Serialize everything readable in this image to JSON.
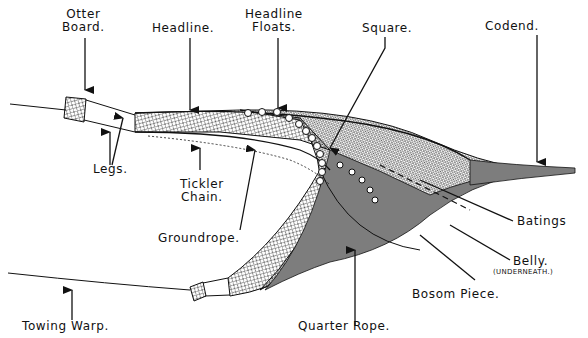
{
  "diagram": {
    "colors": {
      "ink": "#111111",
      "background": "#ffffff"
    },
    "labels": {
      "otter_board": [
        "Otter",
        "Board."
      ],
      "headline": "Headline.",
      "headline_floats": [
        "Headline",
        "Floats."
      ],
      "square": "Square.",
      "codend": "Codend.",
      "legs": "Legs.",
      "tickler_chain": [
        "Tickler",
        "Chain."
      ],
      "groundrope": "Groundrope.",
      "batings": "Batings",
      "belly": "Belly.",
      "belly_note": "(UNDERNEATH.)",
      "bosom_piece": "Bosom Piece.",
      "towing_warp": "Towing Warp.",
      "quarter_rope": "Quarter Rope."
    }
  }
}
